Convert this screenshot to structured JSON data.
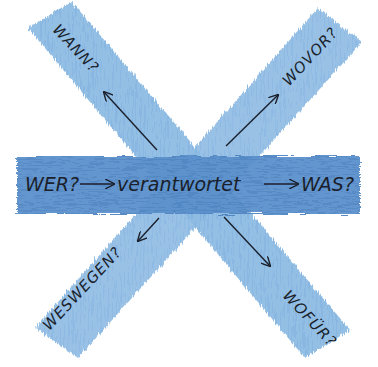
{
  "diagram": {
    "colors": {
      "background": "#ffffff",
      "diagonal_stroke": "#8dbbe3",
      "diagonal_stroke_dark": "#6fa3d6",
      "horizontal_stroke": "#5a8fcb",
      "horizontal_stroke_dark": "#4a7fbd",
      "ink": "#1a1f2b"
    },
    "center_row": {
      "subject": "WER?",
      "verb": "verantwortet",
      "object": "WAS?"
    },
    "branches": [
      {
        "id": "top-left",
        "label": "WANN?",
        "direction": "up-left"
      },
      {
        "id": "top-right",
        "label": "WOVOR?",
        "direction": "up-right"
      },
      {
        "id": "bottom-left",
        "label": "WESWEGEN?",
        "direction": "down-left"
      },
      {
        "id": "bottom-right",
        "label": "WOFÜR?",
        "direction": "down-right"
      }
    ]
  }
}
